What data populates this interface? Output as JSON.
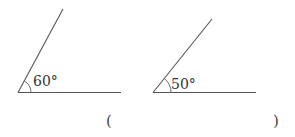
{
  "diagram": {
    "colors": {
      "line": "#555555",
      "text": "#333333",
      "background": "#ffffff"
    },
    "angles": [
      {
        "id": "angle-left",
        "label": "60°",
        "degrees": 60
      },
      {
        "id": "angle-right",
        "label": "50°",
        "degrees": 50
      }
    ],
    "answer": {
      "open_paren": "(",
      "close_paren": ")",
      "value": ""
    }
  }
}
